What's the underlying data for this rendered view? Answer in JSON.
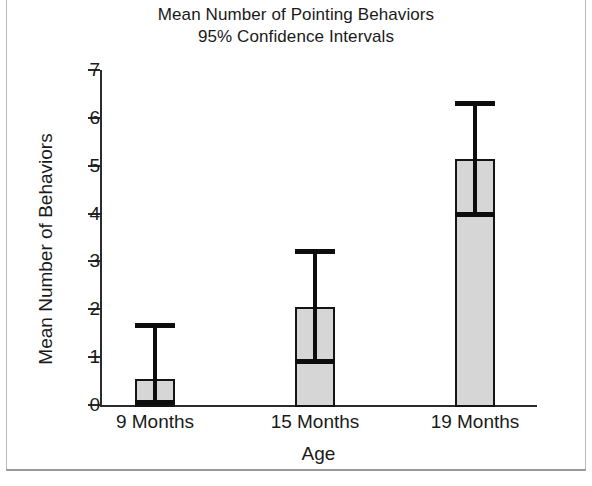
{
  "chart_data": {
    "type": "bar",
    "title": "Mean Number of Pointing Behaviors",
    "subtitle": "95% Confidence Intervals",
    "xlabel": "Age",
    "ylabel": "Mean Number of Behaviors",
    "categories": [
      "9 Months",
      "15 Months",
      "19 Months"
    ],
    "values": [
      0.55,
      2.05,
      5.15
    ],
    "errorbars": [
      {
        "lower": 0.0,
        "upper": 1.72
      },
      {
        "lower": 0.85,
        "upper": 3.25
      },
      {
        "lower": 3.92,
        "upper": 6.35
      }
    ],
    "ylim": [
      0,
      7
    ],
    "yticks": [
      0,
      1,
      2,
      3,
      4,
      5,
      6,
      7
    ],
    "ytick_labels": [
      "0",
      "1",
      "2",
      "3",
      "4",
      "5",
      "6",
      "7"
    ],
    "grid": false,
    "legend": null,
    "bar_fill_color": "#d6d6d6",
    "bar_edge_color": "#141414",
    "errorbar_color": "#0d0d0d",
    "axis_color": "#2b2b2b",
    "background_color": "#ffffff"
  }
}
